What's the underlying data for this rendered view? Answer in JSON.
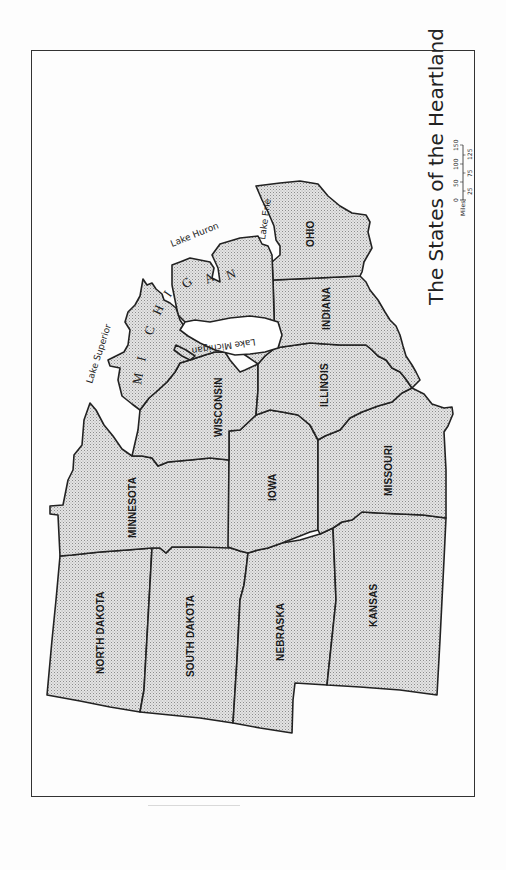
{
  "map": {
    "title": "The States of the Heartland",
    "orientation": "rotated 90° clockwise (north to the left)",
    "states": [
      {
        "id": "north-dakota",
        "label": "NORTH DAKOTA"
      },
      {
        "id": "south-dakota",
        "label": "SOUTH DAKOTA"
      },
      {
        "id": "nebraska",
        "label": "NEBRASKA"
      },
      {
        "id": "kansas",
        "label": "KANSAS"
      },
      {
        "id": "minnesota",
        "label": "MINNESOTA"
      },
      {
        "id": "iowa",
        "label": "IOWA"
      },
      {
        "id": "missouri",
        "label": "MISSOURI"
      },
      {
        "id": "wisconsin",
        "label": "WISCONSIN"
      },
      {
        "id": "illinois",
        "label": "ILLINOIS"
      },
      {
        "id": "indiana",
        "label": "INDIANA"
      },
      {
        "id": "ohio",
        "label": "OHIO"
      },
      {
        "id": "michigan",
        "label": "MICHIGAN",
        "letters": [
          "M",
          "I",
          "C",
          "H",
          "I",
          "G",
          "A",
          "N"
        ]
      }
    ],
    "lakes": [
      {
        "id": "lake-superior",
        "label": "Lake Superior"
      },
      {
        "id": "lake-michigan",
        "label": "Lake Michigan"
      },
      {
        "id": "lake-huron",
        "label": "Lake Huron"
      },
      {
        "id": "lake-erie",
        "label": "Lake Erie"
      }
    ],
    "scale": {
      "unit_label": "Miles",
      "top_ticks": [
        "0",
        "50",
        "100",
        "150"
      ],
      "bottom_ticks": [
        "25",
        "75",
        "125"
      ]
    }
  },
  "colors": {
    "fill_dots": "#9a9a9a",
    "fill_bg": "#e6e6e6",
    "stroke": "#222222",
    "paper": "#fdfdfd"
  }
}
